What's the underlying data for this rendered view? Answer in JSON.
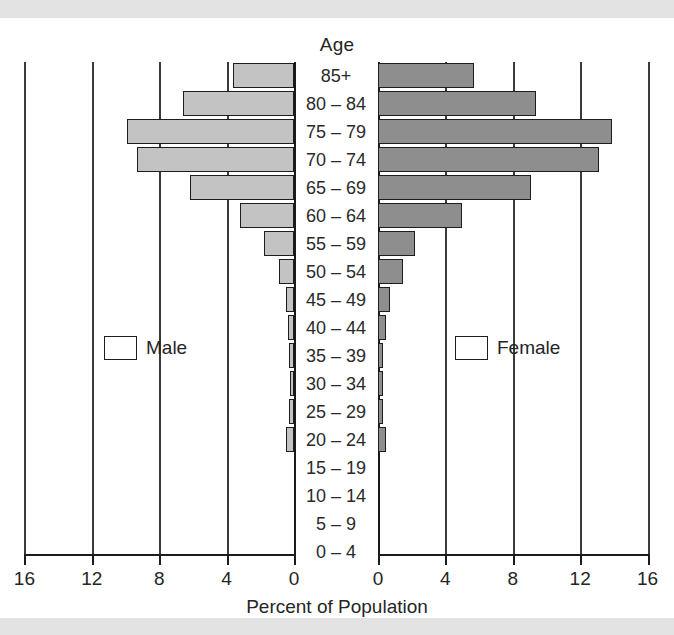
{
  "chart_data": {
    "type": "bar",
    "subtype": "population-pyramid",
    "title": "Age",
    "xlabel": "Percent of Population",
    "ylabel": "Age",
    "grid": true,
    "legend_position": "inside-middle",
    "xlim": [
      0,
      16
    ],
    "xticks": [
      16,
      12,
      8,
      4,
      0,
      0,
      4,
      8,
      12,
      16
    ],
    "left_xticks": [
      16,
      12,
      8,
      4,
      0
    ],
    "right_xticks": [
      0,
      4,
      8,
      12,
      16
    ],
    "categories": [
      "85+",
      "80 – 84",
      "75 – 79",
      "70 – 74",
      "65 – 69",
      "60 – 64",
      "55 – 59",
      "50 – 54",
      "45 – 49",
      "40 – 44",
      "35 – 39",
      "30 – 34",
      "25 – 29",
      "20 – 24",
      "15 – 19",
      "10 – 14",
      "5 – 9",
      "0 – 4"
    ],
    "series": [
      {
        "name": "Male",
        "side": "left",
        "color": "#c3c3c3",
        "values": [
          3.6,
          6.6,
          9.9,
          9.3,
          6.2,
          3.2,
          1.8,
          0.9,
          0.5,
          0.35,
          0.3,
          0.25,
          0.3,
          0.45,
          0.0,
          0.0,
          0.0,
          0.0
        ]
      },
      {
        "name": "Female",
        "side": "right",
        "color": "#8e8e8e",
        "values": [
          5.7,
          9.4,
          13.9,
          13.1,
          9.1,
          5.0,
          2.2,
          1.5,
          0.7,
          0.45,
          0.3,
          0.3,
          0.3,
          0.5,
          0.0,
          0.0,
          0.0,
          0.0
        ]
      }
    ]
  },
  "legend": {
    "male_label": "Male",
    "female_label": "Female"
  },
  "colors": {
    "male": "#c3c3c3",
    "female": "#8e8e8e",
    "outline": "#1d1d1d",
    "grid": "#3a3a3a",
    "band": "#e3e3e3",
    "background": "#ffffff"
  }
}
